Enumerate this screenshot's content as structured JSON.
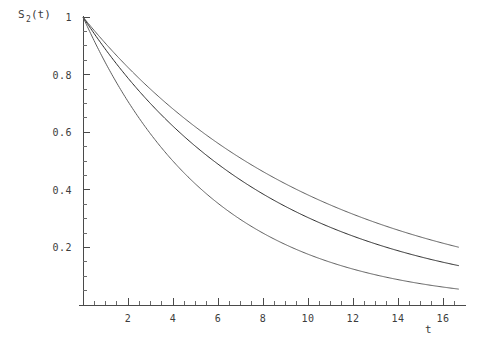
{
  "chart_data": {
    "type": "line",
    "title": "",
    "subtitle": "",
    "ylabel": "S_2(t)",
    "ylabel_base": "S",
    "ylabel_sub": "2",
    "ylabel_tail": "(t)",
    "xlabel": "t",
    "xlim": [
      0,
      16.7
    ],
    "ylim": [
      0,
      1.03
    ],
    "grid": false,
    "legend": "none",
    "x_major_ticks": [
      2,
      4,
      6,
      8,
      10,
      12,
      14,
      16
    ],
    "x_major_labels": [
      "2",
      "4",
      "6",
      "8",
      "10",
      "12",
      "14",
      "16"
    ],
    "x_minor_step": 0.5,
    "y_major_ticks": [
      0.2,
      0.4,
      0.6,
      0.8,
      1
    ],
    "y_major_labels": [
      "0.2",
      "0.4",
      "0.6",
      "0.8",
      "1"
    ],
    "y_minor_step": 0.05,
    "colors": {
      "axis": "#4a4a4a",
      "curve_upper": "#5e5e5e",
      "curve_middle": "#2b2b2b",
      "curve_lower": "#5e5e5e",
      "background": "#ffffff",
      "text": "#3c3c3c"
    },
    "series": [
      {
        "name": "upper-curve",
        "decay_rate": 0.0962,
        "x": [
          0,
          1,
          2,
          3,
          4,
          5,
          6,
          7,
          8,
          9,
          10,
          11,
          12,
          13,
          14,
          15,
          16,
          16.7
        ],
        "values": [
          1.0,
          0.908,
          0.825,
          0.749,
          0.681,
          0.618,
          0.562,
          0.51,
          0.463,
          0.421,
          0.382,
          0.347,
          0.315,
          0.287,
          0.26,
          0.236,
          0.215,
          0.2
        ]
      },
      {
        "name": "middle-curve",
        "decay_rate": 0.1192,
        "x": [
          0,
          1,
          2,
          3,
          4,
          5,
          6,
          7,
          8,
          9,
          10,
          11,
          12,
          13,
          14,
          15,
          16,
          16.7
        ],
        "values": [
          1.0,
          0.888,
          0.788,
          0.699,
          0.621,
          0.551,
          0.489,
          0.434,
          0.385,
          0.342,
          0.304,
          0.27,
          0.239,
          0.212,
          0.189,
          0.167,
          0.149,
          0.137
        ]
      },
      {
        "name": "lower-curve",
        "decay_rate": 0.1735,
        "x": [
          0,
          1,
          2,
          3,
          4,
          5,
          6,
          7,
          8,
          9,
          10,
          11,
          12,
          13,
          14,
          15,
          16,
          16.7
        ],
        "values": [
          1.0,
          0.841,
          0.707,
          0.594,
          0.5,
          0.42,
          0.353,
          0.297,
          0.25,
          0.21,
          0.177,
          0.149,
          0.125,
          0.105,
          0.088,
          0.074,
          0.062,
          0.055
        ]
      }
    ]
  }
}
